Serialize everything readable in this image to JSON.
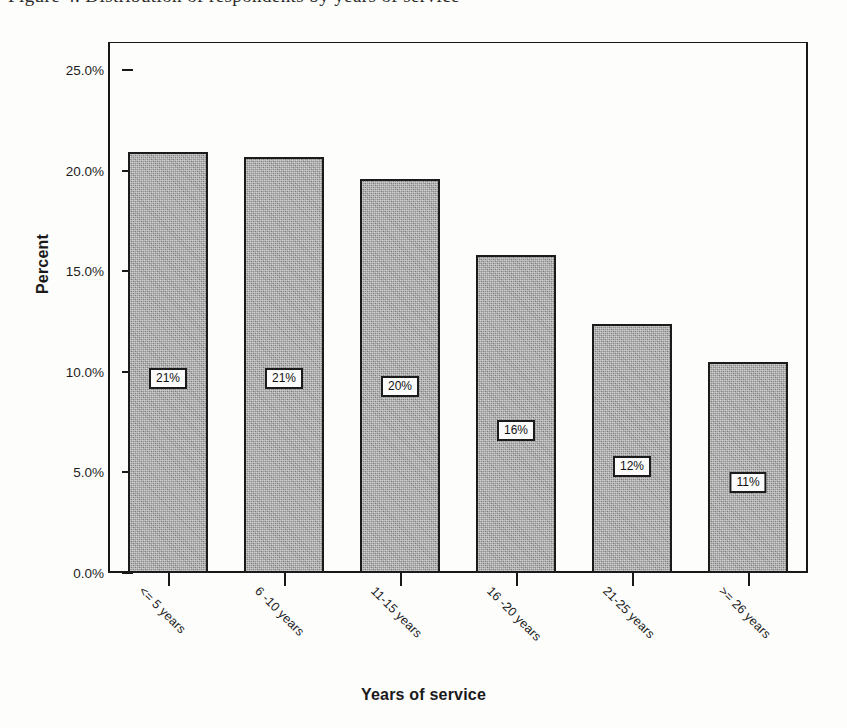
{
  "figure": {
    "caption_remnant": "Figure 4. Distribution of respondents by years of service"
  },
  "chart_data": {
    "type": "bar",
    "title": "",
    "xlabel": "Years of service",
    "ylabel": "Percent",
    "categories": [
      "<= 5 years",
      "6 -10 years",
      "11-15 years",
      "16 -20 years",
      "21-25 years",
      ">= 26 years"
    ],
    "values": [
      20.9,
      20.7,
      19.6,
      15.8,
      12.4,
      10.5
    ],
    "data_labels": [
      "21%",
      "21%",
      "20%",
      "16%",
      "12%",
      "11%"
    ],
    "ylim": [
      0,
      26.4
    ],
    "ytick_values": [
      0.0,
      5.0,
      10.0,
      15.0,
      20.0,
      25.0
    ],
    "ytick_labels": [
      "0.0%",
      "5.0%",
      "10.0%",
      "15.0%",
      "20.0%",
      "25.0%"
    ],
    "grid": false,
    "legend": "none",
    "bar_fill_color": "#8c8c8c",
    "bar_edge_color": "#1b1b1b",
    "axis_color": "#181818",
    "background_color": "#fdfdfc",
    "label_box_positions_percent": [
      10.2,
      10.2,
      9.8,
      7.6,
      5.8,
      5.0
    ]
  }
}
